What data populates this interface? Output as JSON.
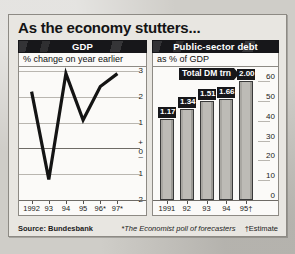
{
  "figure": {
    "title": "As the economy stutters...",
    "source": "Source: Bundesbank",
    "footnote_star": "*The Economist poll of forecasters",
    "footnote_dagger": "†Estimate",
    "ink_color": "#17171a",
    "panel_bg": "#fbfaf8",
    "page_bg": "#cfcdc8"
  },
  "panels": {
    "gdp": {
      "heading": "GDP",
      "subheading": "% change on year earlier"
    },
    "debt": {
      "heading": "Public-sector debt",
      "subheading": "as % of GDP",
      "callout": "Total DM trn"
    }
  },
  "chart_data": [
    {
      "type": "line",
      "title": "GDP",
      "subtitle": "% change on year earlier",
      "xlabel": "",
      "ylabel": "% change on year earlier",
      "categories": [
        "1992",
        "93",
        "94",
        "95",
        "96*",
        "97*"
      ],
      "x_tick_labels": [
        "1992",
        "93",
        "94",
        "95",
        "96*",
        "97*"
      ],
      "values": [
        2.2,
        -1.2,
        2.9,
        1.1,
        2.4,
        2.9
      ],
      "ylim": [
        -2,
        3
      ],
      "y_tick_labels": [
        "3",
        "2",
        "1",
        "0",
        "1",
        "2"
      ],
      "y_tick_values": [
        3,
        2,
        1,
        0,
        -1,
        -2
      ],
      "sign_marker_positive": "+",
      "sign_marker_negative": "–",
      "grid": true,
      "zero_line": true,
      "legend": "none"
    },
    {
      "type": "bar",
      "title": "Public-sector debt",
      "subtitle": "as % of GDP",
      "xlabel": "",
      "ylabel": "as % of GDP",
      "categories": [
        "1991",
        "92",
        "93",
        "94",
        "95†"
      ],
      "values": [
        41,
        46,
        50,
        51,
        60
      ],
      "data_labels": [
        "1.17",
        "1.34",
        "1.51",
        "1.66",
        "2.00"
      ],
      "data_label_units": "Total DM trn",
      "ylim": [
        0,
        60
      ],
      "y_tick_labels": [
        "60",
        "50",
        "40",
        "30",
        "20",
        "10",
        "0"
      ],
      "y_tick_values": [
        60,
        50,
        40,
        30,
        20,
        10,
        0
      ],
      "axis_position": "right",
      "grid": true,
      "legend": "none"
    }
  ]
}
